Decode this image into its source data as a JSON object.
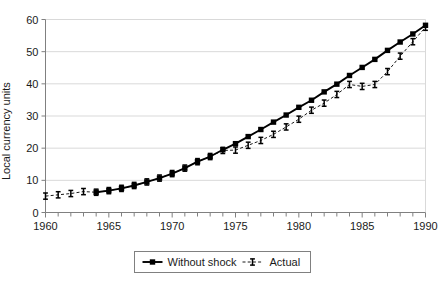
{
  "chart_data": {
    "type": "line",
    "title": "",
    "xlabel": "",
    "ylabel": "Local currency units",
    "xlim": [
      1960,
      1990
    ],
    "ylim": [
      0,
      60
    ],
    "x_tick_labels": [
      "1960",
      "1965",
      "1970",
      "1975",
      "1980",
      "1985",
      "1990"
    ],
    "x_tick_values": [
      1960,
      1965,
      1970,
      1975,
      1980,
      1985,
      1990
    ],
    "x_minor_tick_interval": 1,
    "y_tick_labels": [
      "0",
      "10",
      "20",
      "30",
      "40",
      "50",
      "60"
    ],
    "y_tick_values": [
      0,
      10,
      20,
      30,
      40,
      50,
      60
    ],
    "grid": "horizontal",
    "legend_position": "bottom-center",
    "x": [
      1960,
      1961,
      1962,
      1963,
      1964,
      1965,
      1966,
      1967,
      1968,
      1969,
      1970,
      1971,
      1972,
      1973,
      1974,
      1975,
      1976,
      1977,
      1978,
      1979,
      1980,
      1981,
      1982,
      1983,
      1984,
      1985,
      1986,
      1987,
      1988,
      1989,
      1990
    ],
    "series": [
      {
        "name": "Without shock",
        "marker": "filled-square",
        "line_style": "solid",
        "color": "#000000",
        "values": [
          null,
          null,
          null,
          null,
          6.3,
          6.8,
          7.5,
          8.4,
          9.5,
          10.7,
          12.1,
          13.8,
          15.8,
          17.4,
          19.5,
          21.4,
          23.6,
          25.8,
          28.1,
          30.3,
          32.7,
          34.9,
          37.5,
          39.9,
          42.6,
          45.1,
          47.6,
          50.4,
          53.0,
          55.5,
          58.2
        ]
      },
      {
        "name": "Actual",
        "marker": "error-bar",
        "line_style": "dashed",
        "color": "#000000",
        "values": [
          5.1,
          5.5,
          5.9,
          6.5,
          6.3,
          6.8,
          7.5,
          8.4,
          9.5,
          10.7,
          12.1,
          13.8,
          15.8,
          17.4,
          19.3,
          19.4,
          20.9,
          22.4,
          24.3,
          26.6,
          29.0,
          31.8,
          34.0,
          36.7,
          39.8,
          39.2,
          39.8,
          43.8,
          48.6,
          53.1,
          57.6
        ]
      }
    ]
  },
  "legend": {
    "items": [
      {
        "label": "Without shock",
        "marker": "filled-square",
        "line_style": "solid"
      },
      {
        "label": "Actual",
        "marker": "error-bar",
        "line_style": "dashed"
      }
    ]
  },
  "colors": {
    "series": "#000000",
    "gridline": "#d9d9d9",
    "axis": "#808080",
    "text": "#1a1a1a",
    "background": "#ffffff"
  }
}
